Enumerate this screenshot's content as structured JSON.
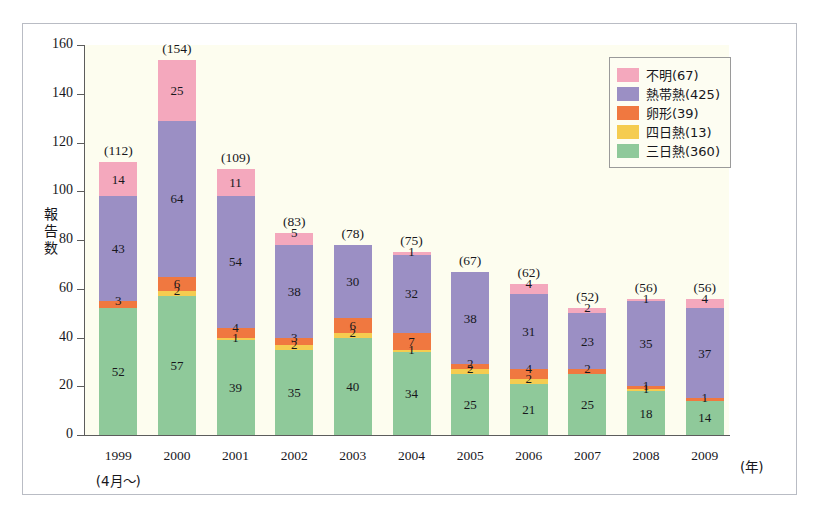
{
  "chart_data": {
    "type": "bar",
    "stacked": true,
    "title": "",
    "xlabel": "(年)",
    "ylabel": "報告数",
    "ylim": [
      0,
      160
    ],
    "ytick_values": [
      0,
      20,
      40,
      60,
      80,
      100,
      120,
      140,
      160
    ],
    "ytick_labels": [
      "0",
      "20",
      "40",
      "60",
      "80",
      "100",
      "120",
      "140",
      "160"
    ],
    "grid": false,
    "legend_position": "top-right",
    "categories": [
      "1999",
      "2000",
      "2001",
      "2002",
      "2003",
      "2004",
      "2005",
      "2006",
      "2007",
      "2008",
      "2009"
    ],
    "category_sublabels": [
      "(4月～)",
      "",
      "",
      "",
      "",
      "",
      "",
      "",
      "",
      "",
      ""
    ],
    "series": [
      {
        "name": "三日熱(360)",
        "legend_label": "三日熱(360)",
        "short": "三日熱",
        "total": 360,
        "color": "#8fc99a",
        "values": [
          52,
          57,
          39,
          35,
          40,
          34,
          25,
          21,
          25,
          18,
          14
        ]
      },
      {
        "name": "四日熱(13)",
        "legend_label": "四日熱(13)",
        "short": "四日熱",
        "total": 13,
        "color": "#f5cc50",
        "values": [
          0,
          2,
          1,
          2,
          2,
          1,
          2,
          2,
          0,
          1,
          0
        ]
      },
      {
        "name": "卵形(39)",
        "legend_label": "卵形(39)",
        "short": "卵形",
        "total": 39,
        "color": "#f07840",
        "values": [
          3,
          6,
          4,
          3,
          6,
          7,
          2,
          4,
          2,
          1,
          1
        ]
      },
      {
        "name": "熱帯熱(425)",
        "legend_label": "熱帯熱(425)",
        "short": "熱帯熱",
        "total": 425,
        "color": "#9b8fc4",
        "values": [
          43,
          64,
          54,
          38,
          30,
          32,
          38,
          31,
          23,
          35,
          37
        ]
      },
      {
        "name": "不明(67)",
        "legend_label": "不明(67)",
        "short": "不明",
        "total": 67,
        "color": "#f4a8bd",
        "values": [
          14,
          25,
          11,
          5,
          0,
          1,
          0,
          4,
          2,
          1,
          4
        ]
      }
    ],
    "bar_totals": [
      "(112)",
      "(154)",
      "(109)",
      "(83)",
      "(78)",
      "(75)",
      "(67)",
      "(62)",
      "(52)",
      "(56)",
      "(56)"
    ],
    "bar_total_values": [
      112,
      154,
      109,
      83,
      78,
      75,
      67,
      62,
      52,
      56,
      56
    ]
  },
  "legend": {
    "items": [
      {
        "label": "不明(67)",
        "color": "#f4a8bd"
      },
      {
        "label": "熱帯熱(425)",
        "color": "#9b8fc4"
      },
      {
        "label": "卵形(39)",
        "color": "#f07840"
      },
      {
        "label": "四日熱(13)",
        "color": "#f5cc50"
      },
      {
        "label": "三日熱(360)",
        "color": "#8fc99a"
      }
    ]
  },
  "axes": {
    "y_title": "報告数",
    "x_unit": "(年)"
  },
  "colors": {
    "plot_background": "#fdfdef",
    "page_background": "#ffffff",
    "frame_border": "#b9bcc4",
    "axis": "#5c5c5c",
    "text": "#17171c"
  }
}
